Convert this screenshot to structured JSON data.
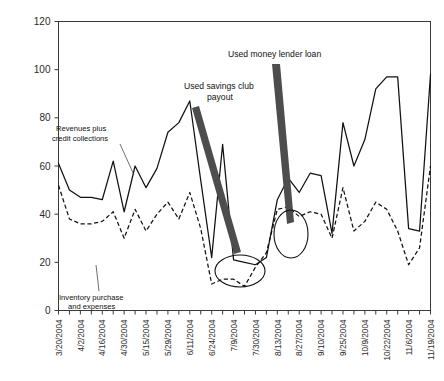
{
  "chart_data": {
    "type": "line",
    "title": "",
    "subtitle": "",
    "xlabel": "",
    "ylabel": "",
    "ylim": [
      0,
      120
    ],
    "yticks": [
      0,
      20,
      40,
      60,
      80,
      100,
      120
    ],
    "grid": false,
    "legend_position": "inline-annotations",
    "x_tick_labels": [
      "3/20/2004",
      "4/2/2004",
      "4/16/2004",
      "4/30/2004",
      "5/15/2004",
      "5/29/2004",
      "6/11/2004",
      "6/24/2004",
      "7/9/2004",
      "7/30/2004",
      "8/13/2004",
      "8/27/2004",
      "9/10/2004",
      "9/25/2004",
      "10/9/2004",
      "10/22/2004",
      "11/6/2004",
      "11/19/2004"
    ],
    "x_label_step": 2,
    "n_points": 35,
    "series": [
      {
        "name": "Revenues plus credit collections",
        "style": "solid",
        "values": [
          61,
          50,
          47,
          47,
          46,
          62,
          41,
          60,
          51,
          59,
          74,
          78,
          87,
          54,
          22,
          69,
          21,
          20,
          19,
          22,
          46,
          55,
          49,
          57,
          56,
          32,
          78,
          60,
          71,
          92,
          97,
          97,
          34,
          33,
          98
        ]
      },
      {
        "name": "Inventory purchase and expenses",
        "style": "dashed",
        "values": [
          52,
          38,
          36,
          36,
          37,
          41,
          30,
          42,
          33,
          40,
          45,
          38,
          49,
          34,
          11,
          13,
          13,
          10,
          18,
          24,
          42,
          43,
          39,
          41,
          40,
          30,
          51,
          33,
          37,
          45,
          42,
          33,
          19,
          26,
          60
        ]
      }
    ],
    "annotations": [
      {
        "name": "savings-club",
        "text_line1": "Used savings club",
        "text_line2": "payout"
      },
      {
        "name": "money-lender",
        "text_line1": "Used money lender loan",
        "text_line2": ""
      },
      {
        "name": "revenues-label",
        "text_line1": "Revenues plus",
        "text_line2": "credit collections"
      },
      {
        "name": "inventory-label",
        "text_line1": "Inventory purchase",
        "text_line2": "and expenses"
      }
    ],
    "colors": {
      "line": "#111111",
      "axis": "#3a3a3a",
      "arrow": "#4d4d4d",
      "background": "#ffffff"
    }
  }
}
